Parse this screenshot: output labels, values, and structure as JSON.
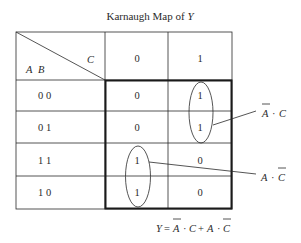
{
  "title": {
    "prefix": "Karnaugh Map of ",
    "variable": "Y"
  },
  "header": {
    "row_vars": [
      "A",
      "B"
    ],
    "col_var": "C",
    "col_values": [
      "0",
      "1"
    ]
  },
  "rows": [
    {
      "label": "0 0",
      "cells": [
        "0",
        "1"
      ]
    },
    {
      "label": "0 1",
      "cells": [
        "0",
        "1"
      ]
    },
    {
      "label": "1 1",
      "cells": [
        "1",
        "0"
      ]
    },
    {
      "label": "1 0",
      "cells": [
        "1",
        "0"
      ]
    }
  ],
  "groups": [
    {
      "term_var1": "A",
      "dot": "·",
      "term_var2": "C",
      "bar_on": "A",
      "cells": "column C=1, rows 00 and 01"
    },
    {
      "term_var1": "A",
      "dot": "·",
      "term_var2": "C",
      "bar_on": "C",
      "cells": "column C=0, rows 11 and 10"
    }
  ],
  "equation": {
    "lhs": "Y",
    "eq": "=",
    "t1a": "A",
    "t1dot": "·",
    "t1b": "C",
    "plus": "+",
    "t2a": "A",
    "t2dot": "·",
    "t2b": "C"
  },
  "colors": {
    "ink": "#2a2a2a",
    "thick_border": "#1a1a1a"
  }
}
